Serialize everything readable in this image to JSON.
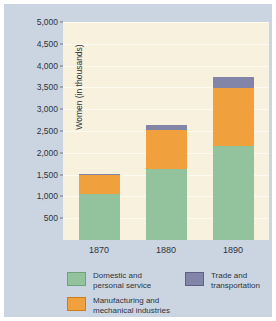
{
  "chart_data": {
    "type": "bar",
    "stacked": true,
    "title": "",
    "xlabel": "",
    "ylabel": "Women (in thousands)",
    "categories": [
      "1870",
      "1880",
      "1890"
    ],
    "series": [
      {
        "name": "Domestic and\npersonal service",
        "color": "#93c39c",
        "values": [
          1060,
          1620,
          2150
        ]
      },
      {
        "name": "Manufacturing and\nmechanical industries",
        "color": "#f0a03c",
        "values": [
          420,
          910,
          1330
        ]
      },
      {
        "name": "Trade and\ntransportation",
        "color": "#8284a8",
        "values": [
          30,
          100,
          270
        ]
      }
    ],
    "totals": [
      1510,
      2630,
      3750
    ],
    "ylim": [
      0,
      5000
    ],
    "yticks": [
      500,
      1000,
      1500,
      2000,
      2500,
      3000,
      3500,
      4000,
      4500,
      5000
    ],
    "ytick_labels": [
      "500",
      "1,000",
      "1,500",
      "2,000",
      "2,500",
      "3,000",
      "3,500",
      "4,000",
      "4,500",
      "5,000"
    ],
    "grid": true,
    "legend_position": "bottom",
    "plot_background": "#f7f1dd",
    "figure_background": "#cbd5e1"
  },
  "legend": {
    "items": [
      {
        "label": "Domestic and\npersonal service",
        "color": "#93c39c"
      },
      {
        "label": "Manufacturing and\nmechanical industries",
        "color": "#f0a03c"
      },
      {
        "label": "Trade and\ntransportation",
        "color": "#8284a8"
      }
    ]
  }
}
